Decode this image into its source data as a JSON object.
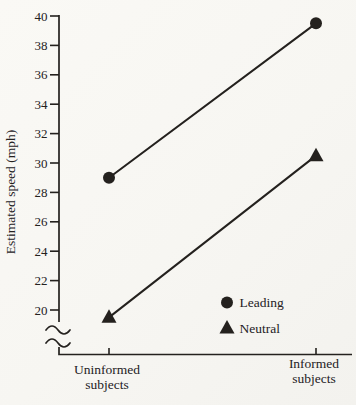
{
  "figure": {
    "kind": "scanned-book-line-graph",
    "background": "#f8f7f3",
    "ink": "#24211e"
  },
  "chart_data": {
    "type": "line",
    "title": "",
    "xlabel": "",
    "ylabel": "Estimated speed (mph)",
    "categories": [
      [
        "Uninformed",
        "subjects"
      ],
      [
        "Informed",
        "subjects"
      ]
    ],
    "yticks": [
      20,
      22,
      24,
      26,
      28,
      30,
      32,
      34,
      36,
      38,
      40
    ],
    "ylim": [
      20,
      40
    ],
    "y_axis_break_below_lowest_tick": true,
    "grid": false,
    "legend_position": "inside-lower-right",
    "series": [
      {
        "name": "Leading",
        "marker": "circle",
        "values": [
          29.0,
          39.5
        ]
      },
      {
        "name": "Neutral",
        "marker": "triangle",
        "values": [
          19.5,
          30.5
        ]
      }
    ]
  }
}
